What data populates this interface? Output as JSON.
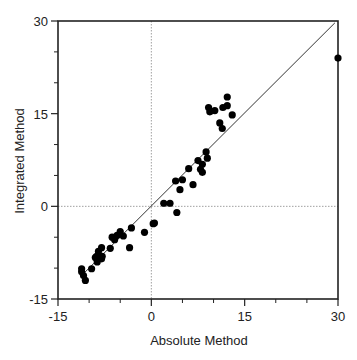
{
  "chart_data": {
    "type": "scatter",
    "title": "",
    "xlabel": "Absolute Method",
    "ylabel": "Integrated Method",
    "xlim": [
      -15,
      30
    ],
    "ylim": [
      -15,
      30
    ],
    "xticks": [
      -15,
      0,
      15,
      30
    ],
    "yticks": [
      -15,
      0,
      15,
      30
    ],
    "xticks_minor": [
      -10,
      -5,
      5,
      10,
      20,
      25
    ],
    "yticks_minor": [
      -10,
      -5,
      5,
      10,
      20,
      25
    ],
    "grid": false,
    "reference_lines": {
      "x_zero_dotted": true,
      "y_zero_dotted": true,
      "identity_line": {
        "from": [
          -11,
          -11
        ],
        "to": [
          29.5,
          29.7
        ]
      }
    },
    "legend": null,
    "series": [
      {
        "name": "samples",
        "marker": "filled-circle",
        "color": "#000000",
        "points": [
          [
            -11.2,
            -10.1
          ],
          [
            -11.2,
            -10.6
          ],
          [
            -10.9,
            -11.2
          ],
          [
            -10.6,
            -12.0
          ],
          [
            -9.6,
            -10.1
          ],
          [
            -9.0,
            -8.3
          ],
          [
            -8.7,
            -9.0
          ],
          [
            -8.0,
            -8.5
          ],
          [
            -8.8,
            -8.1
          ],
          [
            -7.9,
            -8.1
          ],
          [
            -8.5,
            -7.3
          ],
          [
            -8.0,
            -6.7
          ],
          [
            -6.6,
            -6.8
          ],
          [
            -6.3,
            -5.0
          ],
          [
            -5.9,
            -5.4
          ],
          [
            -5.5,
            -4.7
          ],
          [
            -5.0,
            -4.1
          ],
          [
            -4.5,
            -4.8
          ],
          [
            -3.5,
            -6.7
          ],
          [
            -3.2,
            -3.5
          ],
          [
            -1.1,
            -4.2
          ],
          [
            0.3,
            -2.8
          ],
          [
            0.5,
            -2.7
          ],
          [
            2.0,
            0.5
          ],
          [
            3.0,
            0.5
          ],
          [
            4.1,
            -1.0
          ],
          [
            3.9,
            4.1
          ],
          [
            5.0,
            4.3
          ],
          [
            4.6,
            2.7
          ],
          [
            6.7,
            3.5
          ],
          [
            6.0,
            6.1
          ],
          [
            7.5,
            7.4
          ],
          [
            8.2,
            6.8
          ],
          [
            7.9,
            6.0
          ],
          [
            8.2,
            5.5
          ],
          [
            8.8,
            8.8
          ],
          [
            9.0,
            7.8
          ],
          [
            11.0,
            13.5
          ],
          [
            11.4,
            12.6
          ],
          [
            9.2,
            16.0
          ],
          [
            9.4,
            15.3
          ],
          [
            10.2,
            15.5
          ],
          [
            11.5,
            16.0
          ],
          [
            12.2,
            16.3
          ],
          [
            12.2,
            17.7
          ],
          [
            13.0,
            14.8
          ],
          [
            30.0,
            24.0
          ]
        ]
      }
    ]
  },
  "labels": {
    "x_axis": "Absolute Method",
    "y_axis": "Integrated Method"
  }
}
